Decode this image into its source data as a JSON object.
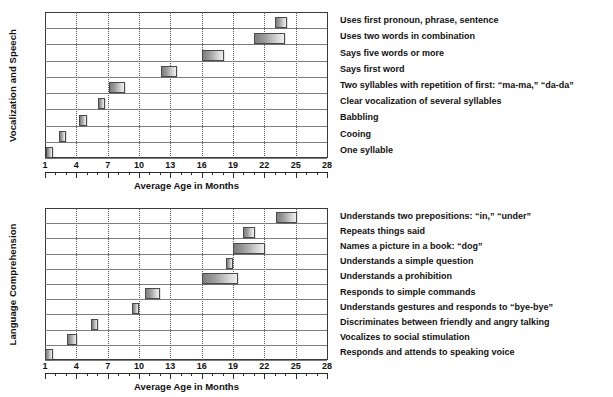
{
  "figure": {
    "background": "#ffffff",
    "bar_fill_dark": "#7e7e7e",
    "bar_fill_light": "#efefef",
    "bar_border": "#4a4a4a",
    "gridline_color": "#555555",
    "axis_color": "#2b2b2b"
  },
  "chart_data": [
    {
      "type": "bar",
      "orientation": "horizontal",
      "id": "vocalization-and-speech",
      "title": "",
      "ylabel": "Vocalization and Speech",
      "xlabel": "Average Age in Months",
      "xlim": [
        1,
        28
      ],
      "xticks": [
        1,
        4,
        7,
        10,
        13,
        16,
        19,
        22,
        25,
        28
      ],
      "xtick_labels": [
        "1",
        "4",
        "7",
        "10",
        "13",
        "16",
        "19",
        "22",
        "25",
        "28"
      ],
      "minor_tick_step": 1,
      "grid": true,
      "grid_axis": "x",
      "grid_style": "dotted",
      "categories": [
        "Uses first pronoun, phrase, sentence",
        "Uses two words in combination",
        "Says five words or more",
        "Says first word",
        "Two syllables with repetition of first: “ma-ma,” “da-da”",
        "Clear vocalization of several syllables",
        "Babbling",
        "Cooing",
        "One syllable"
      ],
      "ranges": [
        [
          23.0,
          24.2
        ],
        [
          21.0,
          24.0
        ],
        [
          16.0,
          18.1
        ],
        [
          12.1,
          13.6
        ],
        [
          7.1,
          8.7
        ],
        [
          6.1,
          6.7
        ],
        [
          4.3,
          5.0
        ],
        [
          2.3,
          3.0
        ],
        [
          1.1,
          1.8
        ]
      ]
    },
    {
      "type": "bar",
      "orientation": "horizontal",
      "id": "language-comprehension",
      "title": "",
      "ylabel": "Language Comprehension",
      "xlabel": "Average Age in Months",
      "xlim": [
        1,
        28
      ],
      "xticks": [
        1,
        4,
        7,
        10,
        13,
        16,
        19,
        22,
        25,
        28
      ],
      "xtick_labels": [
        "1",
        "4",
        "7",
        "10",
        "13",
        "16",
        "19",
        "22",
        "25",
        "28"
      ],
      "minor_tick_step": 1,
      "grid": true,
      "grid_axis": "x",
      "grid_style": "dotted",
      "categories": [
        "Understands two prepositions: “in,” “under”",
        "Repeats things said",
        "Names a picture in a book: “dog”",
        "Understands a simple question",
        "Understands a prohibition",
        "Responds to simple commands",
        "Understands gestures and responds to “bye-bye”",
        "Discriminates between friendly and angry talking",
        "Vocalizes to social stimulation",
        "Responds and attends to speaking voice"
      ],
      "ranges": [
        [
          23.1,
          25.1
        ],
        [
          20.0,
          21.1
        ],
        [
          19.0,
          22.1
        ],
        [
          18.3,
          19.0
        ],
        [
          16.0,
          19.5
        ],
        [
          10.6,
          12.0
        ],
        [
          9.3,
          10.0
        ],
        [
          5.4,
          6.1
        ],
        [
          3.1,
          4.1
        ],
        [
          1.0,
          1.8
        ]
      ]
    }
  ]
}
